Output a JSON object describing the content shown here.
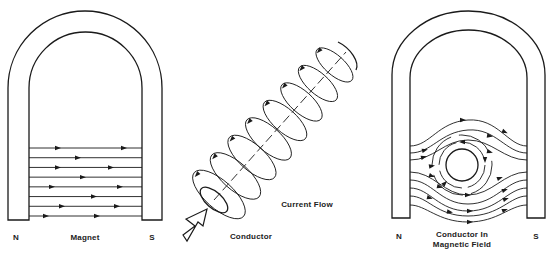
{
  "panels": [
    {
      "id": "magnet",
      "caption": "Magnet",
      "north_label": "N",
      "south_label": "S",
      "field_line_count": 8,
      "field_direction": "N-to-S"
    },
    {
      "id": "conductor",
      "caption": "Conductor",
      "arrow_label": "Current Flow",
      "ring_count": 8
    },
    {
      "id": "conductor-in-field",
      "caption_line1": "Conductor In",
      "caption_line2": "Magnetic Field",
      "north_label": "N",
      "south_label": "S"
    }
  ],
  "colors": {
    "ink": "#1a1a1a",
    "background": "#ffffff"
  }
}
